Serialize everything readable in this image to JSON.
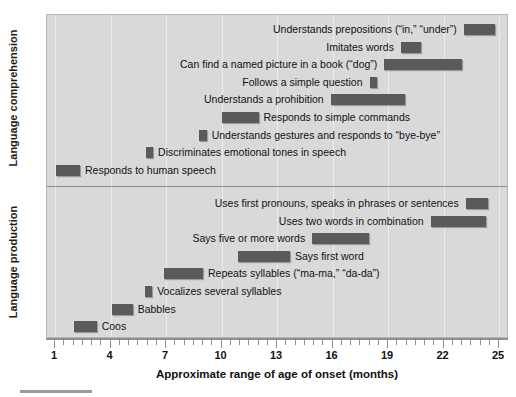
{
  "chart_data": {
    "type": "bar",
    "orientation": "horizontal-range",
    "title": "",
    "xlabel": "Approximate range of age of onset (months)",
    "ylabel": "",
    "xlim": [
      1,
      25
    ],
    "xticks": [
      1,
      4,
      7,
      10,
      13,
      16,
      19,
      22,
      25
    ],
    "xticklabels": [
      "1",
      "4",
      "7",
      "10",
      "13",
      "16",
      "19",
      "22",
      "25"
    ],
    "grid": true,
    "legend": "none",
    "groups": [
      {
        "name": "Language comprehension",
        "items": [
          {
            "label": "Understands prepositions (“in,” “under”)",
            "start": 23.1,
            "end": 24.8,
            "label_side": "left"
          },
          {
            "label": "Imitates words",
            "start": 19.7,
            "end": 20.8,
            "label_side": "left"
          },
          {
            "label": "Can find a named picture in a book (“dog”)",
            "start": 18.8,
            "end": 23.0,
            "label_side": "left"
          },
          {
            "label": "Follows a simple question",
            "start": 18.0,
            "end": 18.4,
            "label_side": "left"
          },
          {
            "label": "Understands a prohibition",
            "start": 15.9,
            "end": 19.9,
            "label_side": "left"
          },
          {
            "label": "Responds to simple commands",
            "start": 10.0,
            "end": 12.0,
            "label_side": "right"
          },
          {
            "label": "Understands gestures and responds to “bye-bye”",
            "start": 8.8,
            "end": 9.2,
            "label_side": "right"
          },
          {
            "label": "Discriminates emotional tones in speech",
            "start": 5.9,
            "end": 6.3,
            "label_side": "right"
          },
          {
            "label": "Responds to human speech",
            "start": 1.05,
            "end": 2.35,
            "label_side": "right"
          }
        ]
      },
      {
        "name": "Language production",
        "items": [
          {
            "label": "Uses first pronouns, speaks in phrases or sentences",
            "start": 23.2,
            "end": 24.4,
            "label_side": "left"
          },
          {
            "label": "Uses two words in combination",
            "start": 21.3,
            "end": 24.3,
            "label_side": "left"
          },
          {
            "label": "Says five or more words",
            "start": 14.9,
            "end": 18.0,
            "label_side": "left"
          },
          {
            "label": "Says first word",
            "start": 10.9,
            "end": 13.7,
            "label_side": "right"
          },
          {
            "label": "Repeats syllables (“ma-ma,” “da-da”)",
            "start": 6.9,
            "end": 9.0,
            "label_side": "right"
          },
          {
            "label": "Vocalizes several syllables",
            "start": 5.85,
            "end": 6.25,
            "label_side": "right"
          },
          {
            "label": "Babbles",
            "start": 4.1,
            "end": 5.2,
            "label_side": "right"
          },
          {
            "label": "Coos",
            "start": 2.0,
            "end": 3.25,
            "label_side": "right"
          }
        ]
      }
    ],
    "colors": {
      "bar": "#5a5a5a",
      "panel": "#d9d9d9",
      "grid": "#ececec",
      "axis": "#8e8e8e",
      "text": "#111111"
    }
  },
  "axis": {
    "y_group_labels": [
      "Language comprehension",
      "Language production"
    ],
    "x_title": "Approximate range of age of onset (months)"
  }
}
